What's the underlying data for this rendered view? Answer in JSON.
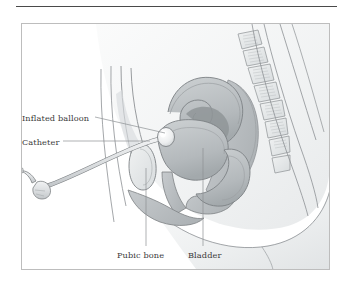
{
  "figure": {
    "type": "medical-illustration",
    "frame": {
      "border_color": "#bdbdbd"
    },
    "top_rule": {
      "color": "#4a4a4a"
    },
    "palette": {
      "outline": "#7d8184",
      "tissue_light": "#eef0f1",
      "tissue_mid": "#d2d6d8",
      "tissue_dark": "#b0b5b8",
      "organ_shadow": "#9aa0a3",
      "catheter": "#dfe2e3",
      "balloon": "#f2f3f4",
      "background": "#ffffff",
      "label_text": "#3a3a3a",
      "leader_line": "#8d9194"
    },
    "labels": [
      {
        "id": "inflated-balloon",
        "text": "Inflated balloon",
        "position": "left-upper"
      },
      {
        "id": "catheter",
        "text": "Catheter",
        "position": "left-middle"
      },
      {
        "id": "pubic-bone",
        "text": "Pubic bone",
        "position": "bottom-left"
      },
      {
        "id": "bladder",
        "text": "Bladder",
        "position": "bottom-right"
      }
    ],
    "structures": [
      "abdominal wall",
      "bladder",
      "pubic bone",
      "uterus",
      "vagina",
      "rectum",
      "sacrum",
      "lumbar vertebrae",
      "urethra",
      "inflated balloon",
      "catheter tube",
      "catheter drainage connector"
    ]
  }
}
